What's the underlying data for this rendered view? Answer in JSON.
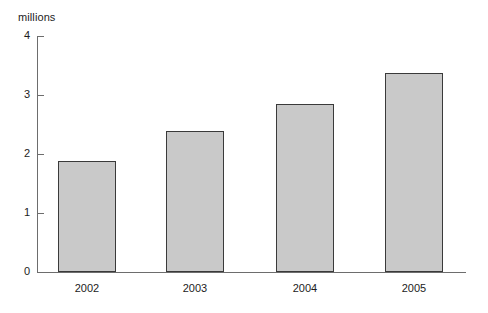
{
  "chart_data": {
    "type": "bar",
    "title": "",
    "subtitle": "",
    "xlabel": "",
    "ylabel": "millions",
    "categories": [
      "2002",
      "2003",
      "2004",
      "2005"
    ],
    "values": [
      1.88,
      2.39,
      2.85,
      3.37
    ],
    "ylim": [
      0,
      4
    ],
    "yticks": [
      "0",
      "1",
      "2",
      "3",
      "4"
    ],
    "ytick_values": [
      0,
      1,
      2,
      3,
      4
    ],
    "grid": false,
    "legend": false,
    "legend_position": "none",
    "annotations": [],
    "colors": {
      "bar_fill": "#c9c9c9",
      "bar_border": "#3a3a3a",
      "axis": "#6d6d6d",
      "text": "#1c1c1c",
      "background": "#ffffff"
    }
  }
}
